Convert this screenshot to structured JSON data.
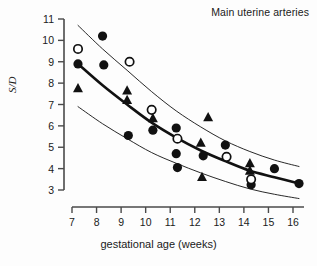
{
  "chart_data": {
    "type": "scatter",
    "title": "Main uterine arteries",
    "xlabel": "gestational age (weeks)",
    "ylabel": "S/D",
    "xlim": [
      6.5,
      16.5
    ],
    "ylim": [
      3,
      11
    ],
    "grid": false,
    "legend": "none",
    "xticks": [
      7,
      8,
      9,
      10,
      11,
      12,
      13,
      14,
      15,
      16
    ],
    "yticks": [
      3,
      4,
      5,
      6,
      7,
      8,
      9,
      10,
      11
    ],
    "series": [
      {
        "name": "filled-circle",
        "marker": "filled circle",
        "color": "#111111",
        "points": [
          {
            "x": 7.0,
            "y": 8.9
          },
          {
            "x": 8.0,
            "y": 10.2
          },
          {
            "x": 8.05,
            "y": 8.85
          },
          {
            "x": 9.05,
            "y": 5.55
          },
          {
            "x": 10.05,
            "y": 5.8
          },
          {
            "x": 11.0,
            "y": 5.9
          },
          {
            "x": 11.0,
            "y": 4.7
          },
          {
            "x": 11.05,
            "y": 4.05
          },
          {
            "x": 12.1,
            "y": 4.6
          },
          {
            "x": 13.0,
            "y": 5.1
          },
          {
            "x": 14.05,
            "y": 3.25
          },
          {
            "x": 15.0,
            "y": 4.0
          },
          {
            "x": 16.0,
            "y": 3.3
          }
        ]
      },
      {
        "name": "open-circle",
        "marker": "open circle",
        "color": "#111111",
        "points": [
          {
            "x": 7.0,
            "y": 9.6
          },
          {
            "x": 9.1,
            "y": 9.0
          },
          {
            "x": 10.0,
            "y": 6.75
          },
          {
            "x": 11.05,
            "y": 5.4
          },
          {
            "x": 13.05,
            "y": 4.55
          },
          {
            "x": 14.05,
            "y": 3.5
          }
        ]
      },
      {
        "name": "filled-triangle",
        "marker": "filled triangle",
        "color": "#111111",
        "points": [
          {
            "x": 7.0,
            "y": 7.75
          },
          {
            "x": 9.0,
            "y": 7.65
          },
          {
            "x": 9.0,
            "y": 7.2
          },
          {
            "x": 10.05,
            "y": 6.35
          },
          {
            "x": 12.3,
            "y": 6.4
          },
          {
            "x": 12.0,
            "y": 5.2
          },
          {
            "x": 12.05,
            "y": 3.6
          },
          {
            "x": 14.0,
            "y": 4.25
          },
          {
            "x": 14.0,
            "y": 3.9
          }
        ]
      }
    ],
    "curves": [
      {
        "name": "upper-reference-curve",
        "style": "thin",
        "points": [
          {
            "x": 7.0,
            "y": 10.7
          },
          {
            "x": 8.0,
            "y": 9.6
          },
          {
            "x": 9.0,
            "y": 8.6
          },
          {
            "x": 10.0,
            "y": 7.6
          },
          {
            "x": 11.0,
            "y": 6.7
          },
          {
            "x": 12.0,
            "y": 5.95
          },
          {
            "x": 13.0,
            "y": 5.3
          },
          {
            "x": 14.0,
            "y": 4.8
          },
          {
            "x": 15.0,
            "y": 4.4
          },
          {
            "x": 16.0,
            "y": 4.1
          }
        ]
      },
      {
        "name": "median-curve",
        "style": "thick",
        "points": [
          {
            "x": 7.0,
            "y": 8.9
          },
          {
            "x": 8.0,
            "y": 7.9
          },
          {
            "x": 9.0,
            "y": 7.0
          },
          {
            "x": 10.0,
            "y": 6.15
          },
          {
            "x": 11.0,
            "y": 5.45
          },
          {
            "x": 12.0,
            "y": 4.85
          },
          {
            "x": 13.0,
            "y": 4.35
          },
          {
            "x": 14.0,
            "y": 3.9
          },
          {
            "x": 15.0,
            "y": 3.6
          },
          {
            "x": 16.0,
            "y": 3.3
          }
        ]
      },
      {
        "name": "lower-reference-curve",
        "style": "thin",
        "points": [
          {
            "x": 7.0,
            "y": 6.9
          },
          {
            "x": 8.0,
            "y": 6.1
          },
          {
            "x": 9.0,
            "y": 5.4
          },
          {
            "x": 10.0,
            "y": 4.75
          },
          {
            "x": 11.0,
            "y": 4.25
          },
          {
            "x": 12.0,
            "y": 3.8
          },
          {
            "x": 13.0,
            "y": 3.4
          },
          {
            "x": 14.0,
            "y": 3.05
          },
          {
            "x": 15.0,
            "y": 2.8
          },
          {
            "x": 16.0,
            "y": 2.6
          }
        ]
      }
    ]
  }
}
